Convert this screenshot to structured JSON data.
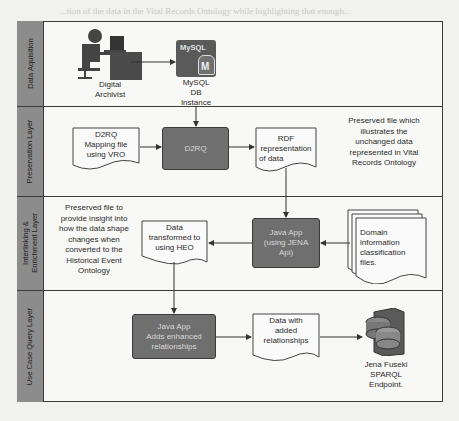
{
  "diagram": {
    "lanes": [
      {
        "id": "data-acquisition",
        "label": "Data Aquisition"
      },
      {
        "id": "preservation",
        "label": "Preservation Layer"
      },
      {
        "id": "interlinking",
        "label": "Interlinking & Enrichment Layer",
        "label_line1": "Interlinking &",
        "label_line2": "Enrichment Layer"
      },
      {
        "id": "use-case",
        "label": "Use Case Query Layer"
      }
    ],
    "nodes": {
      "archivist": {
        "label_line1": "Digital",
        "label_line2": "Archivist"
      },
      "mysql": {
        "badge": "MySQL",
        "db_letter": "M",
        "label_line1": "MySQL",
        "label_line2": "DB",
        "label_line3": "Instance"
      },
      "d2rq_mapping": {
        "line1": "D2RQ",
        "line2": "Mapping file",
        "line3": "using VRO"
      },
      "d2rq": {
        "label": "D2RQ"
      },
      "rdf": {
        "line1": "RDF",
        "line2": "representation",
        "line3": "of data"
      },
      "preserved_note": {
        "line1": "Preserved file which",
        "line2": "illustrates the",
        "line3": "unchanged data",
        "line4": "represented in Vital",
        "line5": "Records Ontology"
      },
      "preserved_note2": {
        "line1": "Preserved file to",
        "line2": "provide insight into",
        "line3": "how the data shape",
        "line4": "changes when",
        "line5": "converted to the",
        "line6": "Historical Event",
        "line7": "Ontology"
      },
      "transformed": {
        "line1": "Data",
        "line2": "transformed to",
        "line3": "using HEO"
      },
      "java_jena": {
        "line1": "Java App",
        "line2": "(using JENA",
        "line3": "Api)"
      },
      "domain_files": {
        "line1": "Domain",
        "line2": "information",
        "line3": "classification",
        "line4": "files."
      },
      "java_enhanced": {
        "line1": "Java App",
        "line2": "Adds enhanced",
        "line3": "relationships"
      },
      "added_rel": {
        "line1": "Data with",
        "line2": "added",
        "line3": "relationships"
      },
      "fuseki": {
        "line1": "Jena Fuseki",
        "line2": "SPARQL",
        "line3": "Endpoint."
      }
    },
    "edges": [
      {
        "from": "archivist",
        "to": "mysql"
      },
      {
        "from": "mysql",
        "to": "d2rq"
      },
      {
        "from": "d2rq_mapping",
        "to": "d2rq"
      },
      {
        "from": "d2rq",
        "to": "rdf"
      },
      {
        "from": "rdf",
        "to": "java_jena"
      },
      {
        "from": "domain_files",
        "to": "java_jena"
      },
      {
        "from": "java_jena",
        "to": "transformed"
      },
      {
        "from": "transformed",
        "to": "java_enhanced"
      },
      {
        "from": "java_enhanced",
        "to": "added_rel"
      },
      {
        "from": "added_rel",
        "to": "fuseki"
      }
    ],
    "colors": {
      "lane_label_bg": "#8c8c8c",
      "process_box": "#6f6f6f",
      "process_text": "#d8d8d8",
      "border": "#3a3a3a"
    }
  },
  "background_bleed": "...tion of the data in the Vital Records Ontology while highlighting that enough..."
}
